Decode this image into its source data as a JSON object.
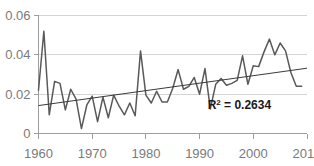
{
  "chart_data": {
    "type": "line",
    "title": "",
    "subtitle": "",
    "xlabel": "",
    "ylabel": "",
    "xlim": [
      1960,
      2010
    ],
    "ylim": [
      0,
      0.06
    ],
    "grid": true,
    "grid_axis": "y",
    "legend": false,
    "x_ticks": [
      "1960",
      "1970",
      "1980",
      "1990",
      "2000",
      "2010"
    ],
    "x_tick_values": [
      1960,
      1970,
      1980,
      1990,
      2000,
      2010
    ],
    "y_ticks": [
      "0",
      "0.02",
      "0.04",
      "0.06"
    ],
    "y_tick_values": [
      0,
      0.02,
      0.04,
      0.06
    ],
    "x": [
      1960,
      1961,
      1962,
      1963,
      1964,
      1965,
      1966,
      1967,
      1968,
      1969,
      1970,
      1971,
      1972,
      1973,
      1974,
      1975,
      1976,
      1977,
      1978,
      1979,
      1980,
      1981,
      1982,
      1983,
      1984,
      1985,
      1986,
      1987,
      1988,
      1989,
      1990,
      1991,
      1992,
      1993,
      1994,
      1995,
      1996,
      1997,
      1998,
      1999,
      2000,
      2001,
      2002,
      2003,
      2004,
      2005,
      2006,
      2007,
      2008,
      2009
    ],
    "series": [
      {
        "name": "observed",
        "color": "#595959",
        "values": [
          0.022,
          0.052,
          0.0095,
          0.0265,
          0.0255,
          0.012,
          0.0225,
          0.0175,
          0.0025,
          0.0145,
          0.019,
          0.006,
          0.0185,
          0.008,
          0.0195,
          0.014,
          0.0095,
          0.0155,
          0.009,
          0.042,
          0.0195,
          0.0155,
          0.0215,
          0.016,
          0.016,
          0.023,
          0.0325,
          0.0225,
          0.024,
          0.0285,
          0.02,
          0.033,
          0.0125,
          0.025,
          0.028,
          0.0245,
          0.0255,
          0.027,
          0.0395,
          0.025,
          0.0345,
          0.034,
          0.0415,
          0.048,
          0.04,
          0.046,
          0.042,
          0.031,
          0.024,
          0.024
        ]
      },
      {
        "name": "linear-trend",
        "color": "#3a3a3a",
        "type": "trend",
        "start_value": 0.0142,
        "end_value": 0.0332
      }
    ],
    "annotations": [
      {
        "name": "r-squared",
        "text": "R² = 0.2634",
        "label_base": "R",
        "label_sup": "2",
        "label_rest": " = 0.2634",
        "x": 1991.5,
        "y": 0.0125
      }
    ],
    "colors": {
      "series_line": "#595959",
      "trend_line": "#3a3a3a",
      "grid": "#d4d4d4",
      "axis": "#9e9e9e",
      "tick_text": "#7a7a7a",
      "annotation_text": "#1a1a1a",
      "background": "#ffffff"
    }
  }
}
